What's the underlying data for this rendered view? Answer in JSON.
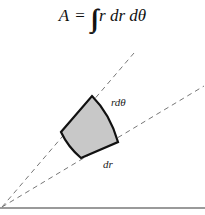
{
  "formula": {
    "lhs": "A",
    "equals": "=",
    "integral": "∬",
    "integrand": "r dr dθ"
  },
  "labels": {
    "arc": "rdθ",
    "radial": "dr"
  },
  "colors": {
    "region_fill": "#c8c8c8",
    "region_stroke": "#111111",
    "ray_stroke": "#777777",
    "axis_stroke": "#999999"
  },
  "geometry": {
    "origin": [
      2,
      207
    ],
    "ray_upper_end": [
      134,
      53
    ],
    "ray_lower_end": [
      204,
      86
    ],
    "region_vertices": {
      "top": [
        92,
        96
      ],
      "left": [
        61,
        132
      ],
      "bottom": [
        81,
        158
      ],
      "right": [
        118,
        142
      ]
    }
  }
}
